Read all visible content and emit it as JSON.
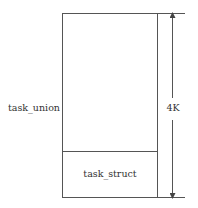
{
  "diagram": {
    "type": "memory-layout",
    "outer_block": {
      "label": "task_union",
      "top_section": {
        "label": ""
      },
      "bottom_section": {
        "label": "task_struct"
      }
    },
    "dimension": {
      "label": "4K",
      "direction": "vertical",
      "arrows": "both-ends"
    },
    "colors": {
      "line": "#555555",
      "text": "#333333",
      "background": "#ffffff"
    }
  }
}
